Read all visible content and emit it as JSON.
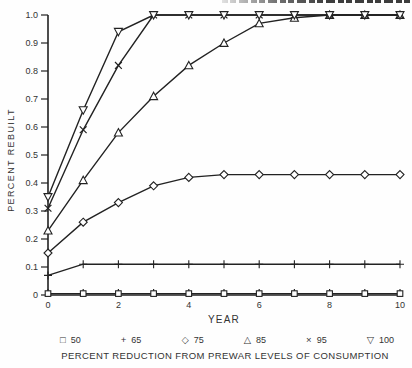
{
  "colors": {
    "ink": "#222222",
    "text": "#333333",
    "background": "#fefefe",
    "marker_fill": "#ffffff"
  },
  "top_edge_clipped_text_visible": true,
  "chart_data": {
    "type": "line",
    "title": "",
    "xlabel": "YEAR",
    "ylabel": "PERCENT REBUILT",
    "caption": "PERCENT REDUCTION FROM PREWAR LEVELS OF CONSUMPTION",
    "xlim": [
      0,
      10
    ],
    "ylim": [
      0,
      1.0
    ],
    "grid": false,
    "legend_position": "bottom",
    "x_ticks": [
      0,
      1,
      2,
      3,
      4,
      5,
      6,
      7,
      8,
      9,
      10
    ],
    "x_tick_labels": [
      "0",
      "",
      "2",
      "",
      "4",
      "",
      "6",
      "",
      "8",
      "",
      "10"
    ],
    "y_ticks": [
      0,
      0.1,
      0.2,
      0.3,
      0.4,
      0.5,
      0.6,
      0.7,
      0.8,
      0.9,
      1.0
    ],
    "y_tick_labels": [
      "0",
      "0.1",
      "0.2",
      "0.3",
      "0.4",
      "0.5",
      "0.6",
      "0.7",
      "0.8",
      "0.9",
      "1.0"
    ],
    "x": [
      0,
      1,
      2,
      3,
      4,
      5,
      6,
      7,
      8,
      9,
      10
    ],
    "series": [
      {
        "name": "50",
        "marker": "square",
        "values": [
          0.005,
          0.005,
          0.005,
          0.005,
          0.005,
          0.005,
          0.005,
          0.005,
          0.005,
          0.005,
          0.005
        ]
      },
      {
        "name": "65",
        "marker": "plus",
        "values": [
          0.07,
          0.11,
          0.11,
          0.11,
          0.11,
          0.11,
          0.11,
          0.11,
          0.11,
          0.11,
          0.11
        ]
      },
      {
        "name": "75",
        "marker": "diamond",
        "values": [
          0.15,
          0.26,
          0.33,
          0.39,
          0.42,
          0.43,
          0.43,
          0.43,
          0.43,
          0.43,
          0.43
        ]
      },
      {
        "name": "85",
        "marker": "triangle-up",
        "values": [
          0.23,
          0.41,
          0.58,
          0.71,
          0.82,
          0.9,
          0.97,
          0.99,
          1.0,
          1.0,
          1.0
        ]
      },
      {
        "name": "95",
        "marker": "x",
        "values": [
          0.31,
          0.59,
          0.82,
          1.0,
          1.0,
          1.0,
          1.0,
          1.0,
          1.0,
          1.0,
          1.0
        ]
      },
      {
        "name": "100",
        "marker": "triangle-down",
        "values": [
          0.35,
          0.66,
          0.94,
          1.0,
          1.0,
          1.0,
          1.0,
          1.0,
          1.0,
          1.0,
          1.0
        ]
      }
    ],
    "legend": [
      {
        "marker": "square",
        "glyph": "□",
        "label": "50"
      },
      {
        "marker": "plus",
        "glyph": "+",
        "label": "65"
      },
      {
        "marker": "diamond",
        "glyph": "◇",
        "label": "75"
      },
      {
        "marker": "triangle-up",
        "glyph": "△",
        "label": "85"
      },
      {
        "marker": "x",
        "glyph": "×",
        "label": "95"
      },
      {
        "marker": "triangle-down",
        "glyph": "▽",
        "label": "100"
      }
    ]
  }
}
